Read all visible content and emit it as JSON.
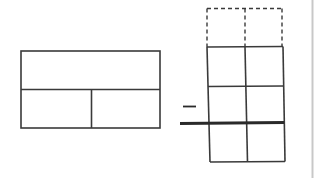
{
  "diagram": {
    "operator": "−",
    "colors": {
      "stroke": "#3a3a3a",
      "dashed_stroke": "#3a3a3a",
      "thick_line": "#2a2a2a",
      "edge_line": "#c8c8c8",
      "background": "#ffffff"
    },
    "bar_model": {
      "top_cells": 1,
      "bottom_cells": 2
    },
    "grid": {
      "columns": 2,
      "dashed_rows": 1,
      "solid_rows_above_line": 2,
      "solid_rows_below_line": 1
    }
  }
}
